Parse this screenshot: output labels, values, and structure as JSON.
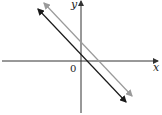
{
  "diagram": {
    "title": "",
    "x_axis_label": "x",
    "y_axis_label": "y",
    "origin_label": "0",
    "lines": [
      {
        "name": "dark-line",
        "color": "#1a1a1a",
        "slope_sign": "negative",
        "arrows": "both"
      },
      {
        "name": "gray-line",
        "color": "#9a9a9a",
        "slope_sign": "negative",
        "arrows": "both"
      }
    ],
    "axis_color": "#333333"
  }
}
